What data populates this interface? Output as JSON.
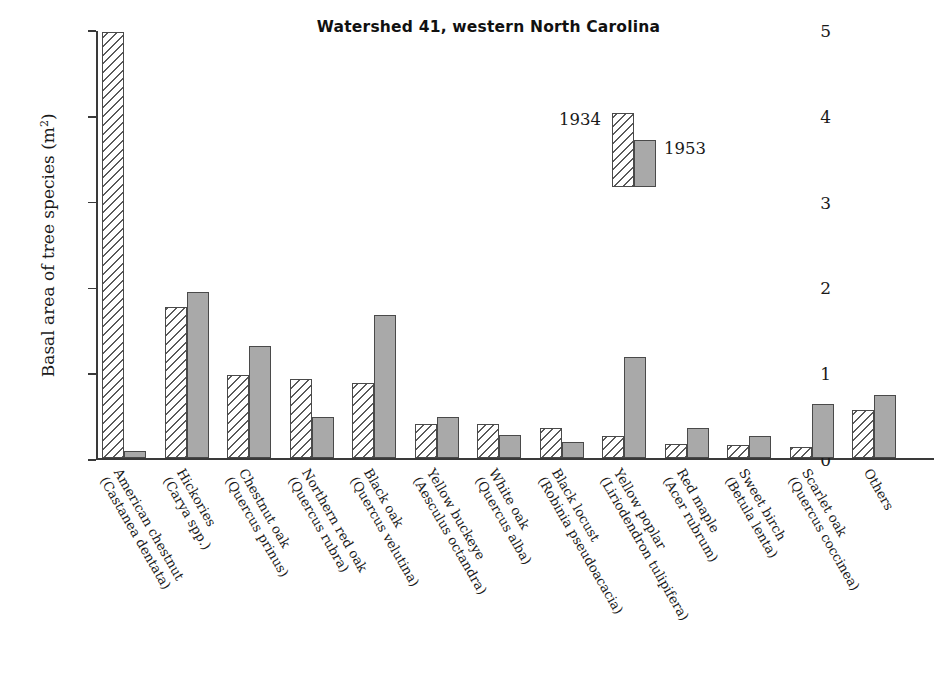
{
  "chart_data": {
    "type": "bar",
    "title": "Watershed 41, western North Carolina",
    "xlabel": "",
    "ylabel": "Basal area of tree species (m²)",
    "ylim": [
      0,
      5
    ],
    "yticks": [
      "0",
      "1",
      "2",
      "3",
      "4",
      "5"
    ],
    "grid": false,
    "legend_position": "top-center",
    "legend": [
      "1934",
      "1953"
    ],
    "categories": [
      "American chestnut (Castanea dentata)",
      "Hickories (Carya spp.)",
      "Chestnut oak (Quercus prinus)",
      "Northern red oak (Quercus rubra)",
      "Black oak (Quercus velutina)",
      "Yellow buckeye (Aesculus octandra)",
      "White oak (Quercus alba)",
      "Black locust (Robinia pseudoacacia)",
      "Yellow poplar (Liriodendron tulipifera)",
      "Red maple (Acer rubrum)",
      "Sweet birch (Betula lenta)",
      "Scarlet oak (Quercus coccinea)",
      "Others"
    ],
    "series": [
      {
        "name": "1934",
        "values": [
          4.97,
          1.77,
          0.97,
          0.93,
          0.88,
          0.4,
          0.4,
          0.35,
          0.26,
          0.17,
          0.16,
          0.13,
          0.56
        ]
      },
      {
        "name": "1953",
        "values": [
          0.09,
          1.94,
          1.31,
          0.48,
          1.67,
          0.48,
          0.27,
          0.19,
          1.18,
          0.35,
          0.26,
          0.63,
          0.74
        ]
      }
    ]
  },
  "title": {
    "text": "Watershed 41, western North Carolina"
  },
  "yaxis": {
    "label_text": "Basal area of tree species (m",
    "label_sup": "2",
    "label_tail": ")",
    "ticks": [
      "5",
      "4",
      "3",
      "2",
      "1",
      "0"
    ]
  },
  "legend": {
    "label_1934": "1934",
    "label_1953": "1953"
  },
  "xlabels": [
    {
      "line1": "American chestnut",
      "line2": "(Castanea dentata)"
    },
    {
      "line1": "Hickories",
      "line2": "(Carya spp.)"
    },
    {
      "line1": "Chestnut oak",
      "line2": "(Quercus prinus)"
    },
    {
      "line1": "Northern red oak",
      "line2": "(Quercus rubra)"
    },
    {
      "line1": "Black oak",
      "line2": "(Quercus velutina)"
    },
    {
      "line1": "Yellow buckeye",
      "line2": "(Aesculus octandra)"
    },
    {
      "line1": "White oak",
      "line2": "(Quercus alba)"
    },
    {
      "line1": "Black locust",
      "line2": "(Robinia pseudoacacia)"
    },
    {
      "line1": "Yellow poplar",
      "line2": "(Liriodendron tulipifera)"
    },
    {
      "line1": "Red maple",
      "line2": "(Acer rubrum)"
    },
    {
      "line1": "Sweet birch",
      "line2": "(Betula lenta)"
    },
    {
      "line1": "Scarlet oak",
      "line2": "(Quercus coccinea)"
    },
    {
      "line1": "Others",
      "line2": ""
    }
  ],
  "colors": {
    "bar_1953_fill": "#a9a9a9",
    "bar_1934_hatch": "#5a5a5a",
    "axis": "#3a3a3a",
    "text": "#1a1a1a"
  }
}
